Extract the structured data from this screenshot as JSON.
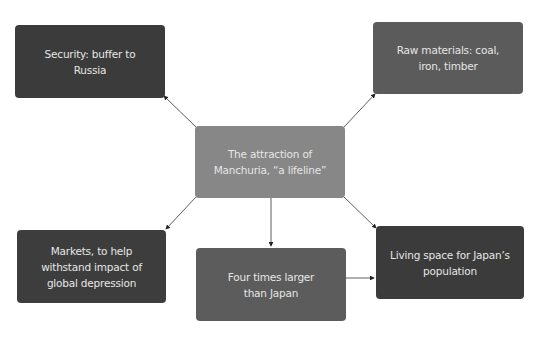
{
  "diagram": {
    "center": {
      "label": "The attraction of Manchuria, “a lifeline”",
      "color": "#878787"
    },
    "nodes": [
      {
        "id": "security",
        "label": "Security: buffer to Russia",
        "color": "#3b3b3b"
      },
      {
        "id": "raw-materials",
        "label": "Raw materials: coal, iron, timber",
        "color": "#5b5b5b"
      },
      {
        "id": "markets",
        "label": "Markets, to help withstand impact of global depression",
        "color": "#3d3d3d"
      },
      {
        "id": "four-times",
        "label": "Four times larger than Japan",
        "color": "#5c5c5c"
      },
      {
        "id": "living-space",
        "label": "Living space for Japan’s population",
        "color": "#3b3b3b"
      }
    ],
    "edges": [
      {
        "from": "center",
        "to": "security"
      },
      {
        "from": "center",
        "to": "raw-materials"
      },
      {
        "from": "center",
        "to": "markets"
      },
      {
        "from": "center",
        "to": "four-times"
      },
      {
        "from": "center",
        "to": "living-space"
      },
      {
        "from": "four-times",
        "to": "living-space"
      }
    ]
  }
}
